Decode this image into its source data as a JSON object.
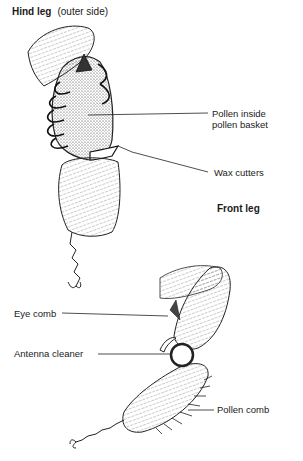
{
  "hind_leg": {
    "title": "Hind leg",
    "subtitle": "(outer side)",
    "labels": {
      "pollen_line1": "Pollen inside",
      "pollen_line2": "pollen basket",
      "wax_cutters": "Wax cutters"
    }
  },
  "front_leg": {
    "title": "Front leg",
    "labels": {
      "eye_comb": "Eye comb",
      "antenna_cleaner": "Antenna cleaner",
      "pollen_comb": "Pollen comb"
    }
  }
}
